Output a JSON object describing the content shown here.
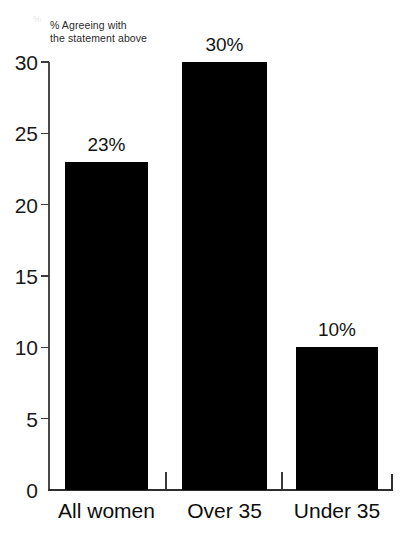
{
  "chart_data": {
    "type": "bar",
    "title": "",
    "subtitle": "",
    "ylabel": "% Agreeing with the statement above",
    "ylabel_line1": "% Agreeing with",
    "ylabel_line2": "the statement above",
    "xlabel": "",
    "categories": [
      "All women",
      "Over 35",
      "Under 35"
    ],
    "values": [
      23,
      30,
      10
    ],
    "data_labels": [
      "23%",
      "30%",
      "10%"
    ],
    "ylim": [
      0,
      30
    ],
    "y_ticks": [
      0,
      5,
      10,
      15,
      20,
      25,
      30
    ],
    "y_tick_labels": [
      "0",
      "5",
      "10",
      "15",
      "20",
      "25",
      "30"
    ],
    "grid": false,
    "legend": false,
    "bar_color": "#000000",
    "axis_color": "#2e2e2e",
    "background_color": "#ffffff"
  },
  "artifact": {
    "mark": "%"
  }
}
